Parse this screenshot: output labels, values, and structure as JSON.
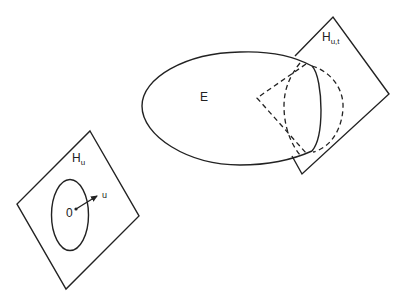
{
  "diagram": {
    "labels": {
      "ellipsoid": "E",
      "hyperplane_u_main": "H",
      "hyperplane_u_sub": "u",
      "hyperplane_ut_main": "H",
      "hyperplane_ut_sub": "u,t",
      "origin": "0",
      "vector": "u"
    },
    "colors": {
      "stroke": "#222222",
      "background": "#ffffff"
    }
  }
}
